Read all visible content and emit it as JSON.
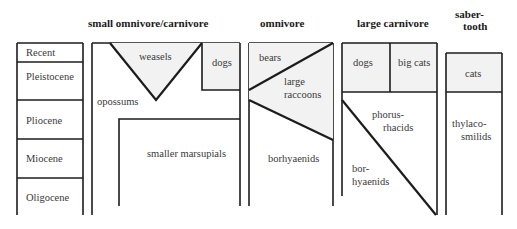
{
  "headers": {
    "small": "small omnivore/carnivore",
    "omnivore": "omnivore",
    "large": "large carnivore",
    "saber_line1": "saber-",
    "saber_line2": "tooth"
  },
  "epochs": [
    "Recent",
    "Pleistocene",
    "Pliocene",
    "Miocene",
    "Oligocene"
  ],
  "labels": {
    "weasels": "weasels",
    "dogs_small": "dogs",
    "opossums": "opossums",
    "smaller_marsupials": "smaller marsupials",
    "bears": "bears",
    "raccoons_1": "large",
    "raccoons_2": "raccoons",
    "borhyaenids_omni": "borhyaenids",
    "dogs_large": "dogs",
    "big_cats": "big cats",
    "phorus_1": "phorus-",
    "phorus_2": "rhacids",
    "bor_1": "bor-",
    "bor_2": "hyaenids",
    "cats": "cats",
    "thylaco_1": "thylaco-",
    "thylaco_2": "smilids"
  },
  "colors": {
    "line": "#1c1c1c",
    "shade": "#f2f2f2",
    "text": "#3a3a3a"
  }
}
